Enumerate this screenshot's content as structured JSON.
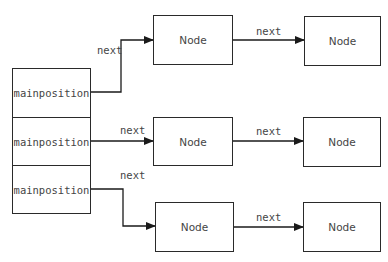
{
  "diagram": {
    "slots": [
      {
        "label": "mainposition"
      },
      {
        "label": "mainposition"
      },
      {
        "label": "mainposition"
      }
    ],
    "chains": [
      {
        "link_label": "next",
        "nodes": [
          {
            "label": "Node"
          },
          {
            "label": "Node"
          }
        ],
        "node_link_label": "next"
      },
      {
        "link_label": "next",
        "nodes": [
          {
            "label": "Node"
          },
          {
            "label": "Node"
          }
        ],
        "node_link_label": "next"
      },
      {
        "link_label": "next",
        "nodes": [
          {
            "label": "Node"
          },
          {
            "label": "Node"
          }
        ],
        "node_link_label": "next"
      }
    ],
    "colors": {
      "line": "#1a1a1a",
      "text": "#444444",
      "background": "#ffffff"
    }
  }
}
